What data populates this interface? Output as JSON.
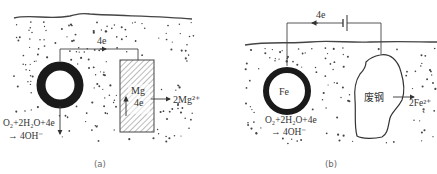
{
  "diagram": {
    "colors": {
      "line": "#444444",
      "ring": "#1a1a1a",
      "dots": "#444444",
      "text": "#333333"
    },
    "panel_a": {
      "caption": "(a)",
      "electron_flow_label": "4e",
      "anode_label": "Mg",
      "anode_electron_label": "4e",
      "anode_product": "2Mg²⁺",
      "cathode_reaction_line1": "O₂+2H₂O+4e",
      "cathode_reaction_line2": "→ 4OH⁻"
    },
    "panel_b": {
      "caption": "(b)",
      "electron_flow_label": "4e",
      "cathode_label": "Fe",
      "anode_label": "废钢",
      "anode_product": "2Fe²⁺",
      "cathode_reaction_line1": "O₂+2H₂O+4e",
      "cathode_reaction_line2": "→ 4OH⁻"
    }
  }
}
